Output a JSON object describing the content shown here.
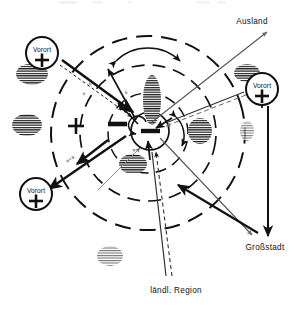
{
  "figure": {
    "type": "schematic-diagram",
    "background_color": "#ffffff",
    "ink_color": "#111111"
  },
  "top_cutoff_text": "",
  "labels": {
    "ausland": "Ausland",
    "grossstadt": "Großstadt",
    "laendl_region": "ländl. Region",
    "vorort_top_left": "Vorort",
    "vorort_bottom_left": "Vorort",
    "vorort_right": "Vorort"
  },
  "signs": {
    "plus": "+",
    "minus": "−",
    "center_minus": "−",
    "node_plus": "+"
  },
  "annotations": {
    "flow_label_w": "w",
    "flow_label_a": "a",
    "flow_label_wa": "w+a"
  },
  "zones": {
    "outer_ring_style": "dashed",
    "middle_ring_style": "dashed",
    "inner_ring_style": "dashed",
    "core_style": "solid"
  },
  "hatched_blobs": {
    "count": 7,
    "style": "horizontal-hatch-ellipse",
    "meaning": "Siedlungsfläche"
  },
  "colors": {
    "ink": "#111111",
    "thin_ink": "#3a3a3a",
    "faint": "#9a9a9a"
  }
}
